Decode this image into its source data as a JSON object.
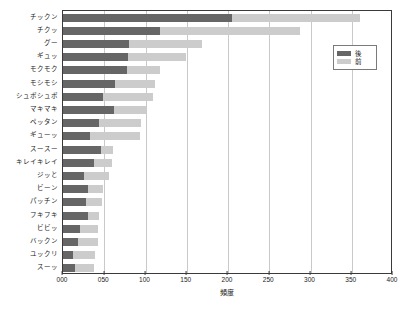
{
  "chart_data": {
    "type": "bar",
    "orientation": "horizontal",
    "stacked": true,
    "title": "",
    "xlabel": "頻度",
    "ylabel": "",
    "xlim": [
      0,
      400
    ],
    "ylim": null,
    "grid": true,
    "legend_position": "top-right",
    "xticks": [
      "000",
      "050",
      "100",
      "150",
      "200",
      "250",
      "300",
      "350",
      "400"
    ],
    "xtick_values": [
      0,
      50,
      100,
      150,
      200,
      250,
      300,
      350,
      400
    ],
    "categories": [
      "チックン",
      "チクッ",
      "グー",
      "ギュッ",
      "モクモク",
      "モシモシ",
      "シュボシュボ",
      "マキマキ",
      "ペッタン",
      "ギューッ",
      "スースー",
      "キレイキレイ",
      "ジッと",
      "ビーン",
      "パッチン",
      "フキフキ",
      "ビビッ",
      "バックン",
      "ユックリ",
      "スーッ"
    ],
    "series": [
      {
        "name": "後",
        "color": "#666666",
        "values": [
          205,
          117,
          80,
          79,
          78,
          63,
          49,
          62,
          44,
          33,
          46,
          37,
          26,
          30,
          28,
          30,
          20,
          18,
          12,
          14
        ]
      },
      {
        "name": "前",
        "color": "#cccccc",
        "values": [
          155,
          170,
          89,
          70,
          40,
          48,
          60,
          39,
          50,
          60,
          15,
          22,
          30,
          18,
          19,
          14,
          23,
          24,
          27,
          23
        ]
      }
    ],
    "totals": [
      360,
      287,
      169,
      149,
      118,
      111,
      109,
      101,
      94,
      93,
      61,
      59,
      56,
      48,
      47,
      44,
      43,
      42,
      39,
      37
    ]
  },
  "legend": {
    "items": [
      {
        "label": "後",
        "color": "#666666"
      },
      {
        "label": "前",
        "color": "#cccccc"
      }
    ]
  }
}
